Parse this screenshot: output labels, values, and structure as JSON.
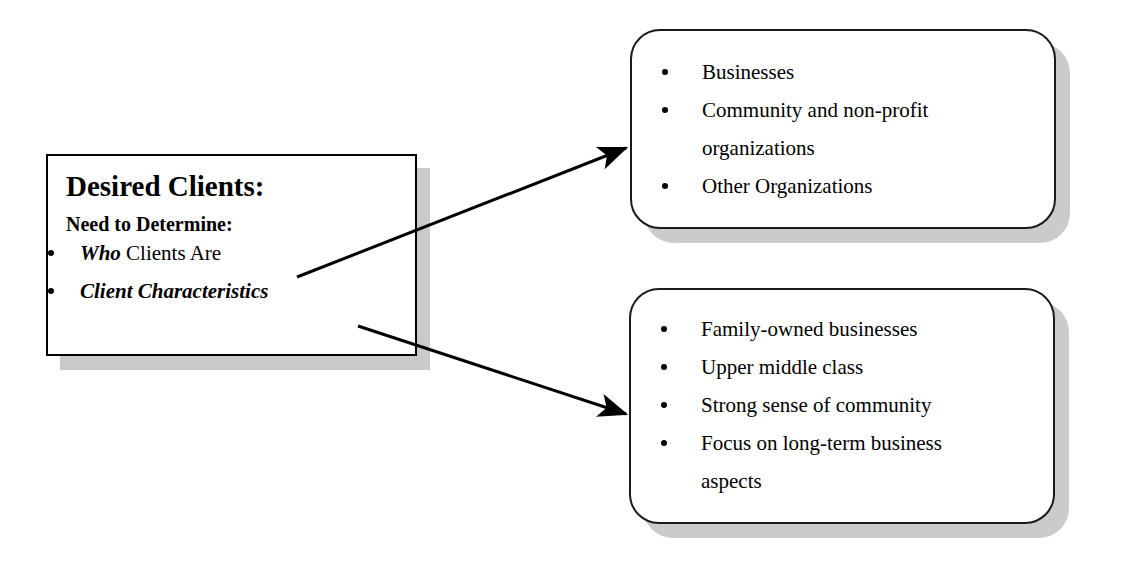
{
  "diagram": {
    "title": "Desired Clients",
    "background_color": "#ffffff",
    "line_color": "#000000",
    "shadow_color": "#c9c9c9"
  },
  "source_node": {
    "title": "Desired Clients:",
    "subtitle": "Need to Determine:",
    "items": [
      {
        "emphasis": "Who",
        "rest": " Clients Are",
        "full": "Who Clients Are"
      },
      {
        "emphasis": "Client Characteristics",
        "rest": "",
        "full": "Client Characteristics"
      }
    ]
  },
  "target_nodes": [
    {
      "id": "who-clients-are",
      "items": [
        "Businesses",
        "Community and non-profit organizations",
        "Other Organizations"
      ]
    },
    {
      "id": "client-characteristics",
      "items": [
        "Family-owned businesses",
        "Upper middle class",
        "Strong sense of community",
        "Focus on long-term business aspects"
      ]
    }
  ],
  "connectors": [
    {
      "id": "arrow-to-who-clients-are",
      "from": "who-clients-are-item",
      "to": "top-right-box",
      "direction": "up-right"
    },
    {
      "id": "arrow-to-client-characteristics",
      "from": "client-characteristics-item",
      "to": "bottom-right-box",
      "direction": "down-right"
    }
  ]
}
